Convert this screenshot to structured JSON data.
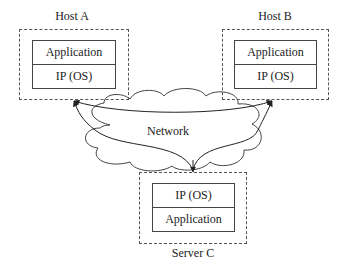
{
  "diagram": {
    "nodes": [
      {
        "id": "host-a",
        "label": "Host A",
        "layers": [
          "Application",
          "IP (OS)"
        ]
      },
      {
        "id": "host-b",
        "label": "Host B",
        "layers": [
          "Application",
          "IP (OS)"
        ]
      },
      {
        "id": "server-c",
        "label": "Server C",
        "layers": [
          "IP (OS)",
          "Application"
        ]
      }
    ],
    "network": {
      "label": "Network"
    },
    "edges": [
      {
        "from": "server-c",
        "to": "host-a"
      },
      {
        "from": "server-c",
        "to": "host-b"
      },
      {
        "from": "host-a",
        "to": "host-b"
      }
    ]
  }
}
